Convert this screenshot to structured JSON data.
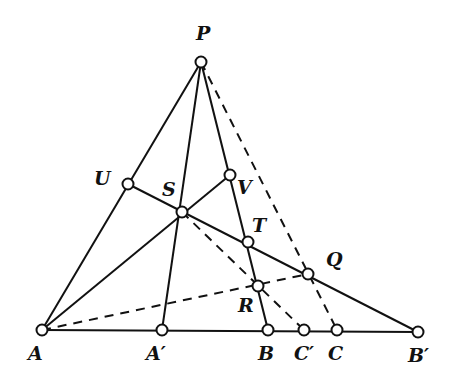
{
  "figure": {
    "type": "projective-geometry-construction",
    "points": {
      "P": {
        "label": "P",
        "x": 201,
        "y": 62,
        "lx": 196,
        "ly": 40
      },
      "U": {
        "label": "U",
        "x": 128,
        "y": 184,
        "lx": 94,
        "ly": 185
      },
      "S": {
        "label": "S",
        "x": 182,
        "y": 212,
        "lx": 162,
        "ly": 196
      },
      "V": {
        "label": "V",
        "x": 230,
        "y": 175,
        "lx": 237,
        "ly": 194
      },
      "T": {
        "label": "T",
        "x": 248,
        "y": 242,
        "lx": 252,
        "ly": 232
      },
      "R": {
        "label": "R",
        "x": 258,
        "y": 286,
        "lx": 238,
        "ly": 312
      },
      "Q": {
        "label": "Q",
        "x": 308,
        "y": 274,
        "lx": 326,
        "ly": 266
      },
      "A": {
        "label": "A",
        "x": 42,
        "y": 330,
        "lx": 28,
        "ly": 360
      },
      "A1": {
        "label": "A′",
        "x": 162,
        "y": 330,
        "lx": 146,
        "ly": 360
      },
      "B": {
        "label": "B",
        "x": 268,
        "y": 330,
        "lx": 258,
        "ly": 360
      },
      "C1": {
        "label": "C′",
        "x": 304,
        "y": 330,
        "lx": 294,
        "ly": 360
      },
      "C": {
        "label": "C",
        "x": 337,
        "y": 330,
        "lx": 328,
        "ly": 360
      },
      "B1": {
        "label": "B′",
        "x": 418,
        "y": 332,
        "lx": 408,
        "ly": 362
      }
    },
    "segments": [
      {
        "from": "P",
        "to": "A",
        "style": "solid"
      },
      {
        "from": "P",
        "to": "A1",
        "style": "solid"
      },
      {
        "from": "P",
        "to": "B",
        "style": "solid"
      },
      {
        "from": "A",
        "to": "B1",
        "style": "solid"
      },
      {
        "from": "A",
        "to": "V",
        "style": "solid"
      },
      {
        "from": "U",
        "to": "B1",
        "style": "solid"
      },
      {
        "from": "P",
        "to": "C",
        "style": "dashed"
      },
      {
        "from": "A",
        "to": "Q",
        "style": "dashed"
      },
      {
        "from": "S",
        "to": "C1",
        "style": "dashed"
      }
    ]
  }
}
